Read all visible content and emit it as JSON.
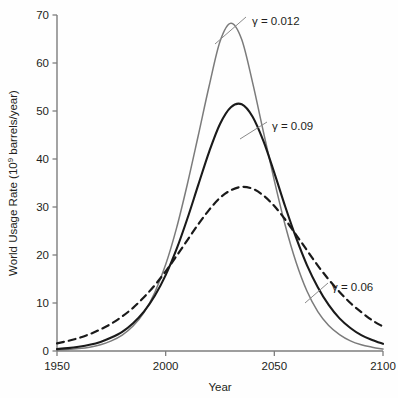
{
  "chart_data": {
    "type": "line",
    "title": "",
    "xlabel": "Year",
    "ylabel": "World Usage Rate (10⁹ barrels/year)",
    "ylabel_parts": {
      "prefix": "World Usage Rate (10",
      "exponent": "9",
      "suffix": " barrels/year)"
    },
    "xlim": [
      1950,
      2100
    ],
    "ylim": [
      0,
      70
    ],
    "xticks": [
      1950,
      2000,
      2050,
      2100
    ],
    "xtick_labels": [
      "1950",
      "2000",
      "2050",
      "2100"
    ],
    "yticks": [
      0,
      10,
      20,
      30,
      40,
      50,
      60,
      70
    ],
    "ytick_labels": [
      "0",
      "10",
      "20",
      "30",
      "40",
      "50",
      "60",
      "70"
    ],
    "grid": false,
    "legend_position": "inline-annotations",
    "x": [
      1950,
      1955,
      1960,
      1965,
      1970,
      1975,
      1980,
      1985,
      1990,
      1995,
      2000,
      2005,
      2010,
      2015,
      2020,
      2025,
      2030,
      2035,
      2040,
      2045,
      2050,
      2055,
      2060,
      2065,
      2070,
      2075,
      2080,
      2085,
      2090,
      2095,
      2100
    ],
    "series": [
      {
        "name": "γ = 0.012",
        "label": "γ = 0.012",
        "style": "solid",
        "color": "#7b7b7b",
        "peak_year": 2024,
        "peak_value": 68.5,
        "values": [
          0.2,
          0.3,
          0.5,
          0.8,
          1.3,
          2.1,
          3.3,
          5.2,
          8.0,
          12.2,
          18.0,
          25.6,
          34.8,
          44.9,
          55.2,
          64.5,
          68.3,
          64.9,
          55.9,
          45.6,
          35.5,
          26.2,
          18.5,
          12.5,
          8.2,
          5.3,
          3.4,
          2.1,
          1.3,
          0.8,
          0.4
        ]
      },
      {
        "name": "γ = 0.09",
        "label": "γ = 0.09",
        "style": "solid",
        "color": "#1a1a1a",
        "peak_year": 2025,
        "peak_value": 51.5,
        "values": [
          0.4,
          0.6,
          0.9,
          1.3,
          1.9,
          2.8,
          4.0,
          5.8,
          8.2,
          11.5,
          15.8,
          21.2,
          27.6,
          34.6,
          41.5,
          47.3,
          50.8,
          51.4,
          48.8,
          43.7,
          37.1,
          30.1,
          23.6,
          17.9,
          13.3,
          9.6,
          6.8,
          4.8,
          3.3,
          2.3,
          1.5
        ]
      },
      {
        "name": "γ = 0.06",
        "label": "γ = 0.06",
        "style": "dashed",
        "color": "#1a1a1a",
        "peak_year": 2026,
        "peak_value": 34.3,
        "values": [
          1.6,
          2.1,
          2.7,
          3.5,
          4.5,
          5.7,
          7.2,
          9.0,
          11.2,
          13.7,
          16.6,
          19.8,
          23.1,
          26.4,
          29.4,
          31.9,
          33.5,
          34.2,
          33.8,
          32.4,
          30.2,
          27.4,
          24.2,
          21.0,
          17.8,
          14.9,
          12.3,
          10.0,
          8.1,
          6.4,
          5.1
        ]
      }
    ],
    "annotations": [
      {
        "name": "gamma-0012-annotation",
        "text": "γ = 0.012",
        "label_x": 252,
        "label_y": 21,
        "leader_from_x": 246,
        "leader_from_y": 17,
        "leader_to_x": 215,
        "leader_to_y": 44
      },
      {
        "name": "gamma-009-annotation",
        "text": "γ = 0.09",
        "label_x": 272,
        "label_y": 126,
        "leader_from_x": 267,
        "leader_from_y": 122,
        "leader_to_x": 240,
        "leader_to_y": 139
      },
      {
        "name": "gamma-006-annotation",
        "text": "γ = 0.06",
        "label_x": 332,
        "label_y": 287,
        "leader_from_x": 328,
        "leader_from_y": 283,
        "leader_to_x": 305,
        "leader_to_y": 303
      }
    ],
    "axis_color": "#7d7d7d",
    "background": "#fefefe"
  },
  "plot_geometry": {
    "left": 57,
    "right": 383,
    "top": 15,
    "bottom": 351
  }
}
